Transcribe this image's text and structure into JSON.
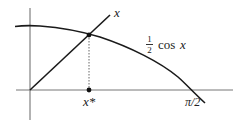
{
  "figure": {
    "colors": {
      "background": "#ffffff",
      "axes": "#555555",
      "curves": "#1a1a1a",
      "dotted": "#666666",
      "text": "#222222"
    },
    "curves": [
      {
        "name": "identity-line",
        "label": "x"
      },
      {
        "name": "half-cosine-curve",
        "label_numerator": "1",
        "label_denominator": "2",
        "label_text": "cos",
        "label_var": "x"
      }
    ],
    "markers": {
      "intersection_label": "x*",
      "axis_end_label": "π/2"
    }
  }
}
